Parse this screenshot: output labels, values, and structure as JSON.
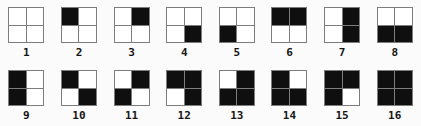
{
  "colors": {
    "filled": "#0f0f0f",
    "empty": "#ffffff",
    "grid_line": "#7d7d7d",
    "background": "#fbfbfb",
    "label_text": "#151515"
  },
  "cells": [
    {
      "label": "1",
      "filled": []
    },
    {
      "label": "2",
      "filled": [
        "tl"
      ]
    },
    {
      "label": "3",
      "filled": [
        "tr"
      ]
    },
    {
      "label": "4",
      "filled": [
        "br"
      ]
    },
    {
      "label": "5",
      "filled": [
        "bl"
      ]
    },
    {
      "label": "6",
      "filled": [
        "tl",
        "tr"
      ]
    },
    {
      "label": "7",
      "filled": [
        "tr",
        "br"
      ]
    },
    {
      "label": "8",
      "filled": [
        "bl",
        "br"
      ]
    },
    {
      "label": "9",
      "filled": [
        "tl",
        "bl"
      ]
    },
    {
      "label": "10",
      "filled": [
        "tl",
        "br"
      ]
    },
    {
      "label": "11",
      "filled": [
        "tr",
        "bl"
      ]
    },
    {
      "label": "12",
      "filled": [
        "tl",
        "tr",
        "br"
      ]
    },
    {
      "label": "13",
      "filled": [
        "tr",
        "bl",
        "br"
      ]
    },
    {
      "label": "14",
      "filled": [
        "tl",
        "bl",
        "br"
      ]
    },
    {
      "label": "15",
      "filled": [
        "tl",
        "tr",
        "bl"
      ]
    },
    {
      "label": "16",
      "filled": [
        "tl",
        "tr",
        "bl",
        "br"
      ]
    }
  ]
}
